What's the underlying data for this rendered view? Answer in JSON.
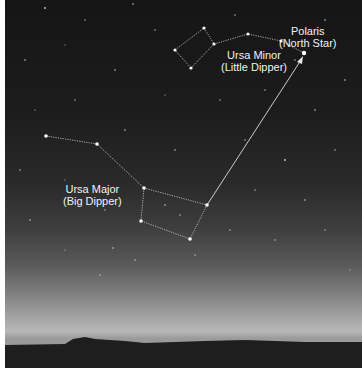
{
  "scene": "Night sky over horizon showing Ursa Major and Ursa Minor with pointer to Polaris",
  "labels": {
    "polaris": {
      "line1": "Polaris",
      "line2": "(North Star)"
    },
    "ursa_minor": {
      "line1": "Ursa Minor",
      "line2": "(Little Dipper)"
    },
    "ursa_major": {
      "line1": "Ursa Major",
      "line2": "(Big Dipper)"
    }
  },
  "constellations": {
    "ursa_minor_stars": [
      [
        170,
        50
      ],
      [
        199,
        28
      ],
      [
        209,
        44
      ],
      [
        243,
        34
      ],
      [
        276,
        41
      ],
      [
        299,
        53
      ],
      [
        186,
        68
      ]
    ],
    "ursa_major_stars": [
      [
        41,
        136
      ],
      [
        92,
        144
      ],
      [
        139,
        188
      ],
      [
        202,
        205
      ],
      [
        185,
        239
      ],
      [
        136,
        221
      ]
    ]
  },
  "colors": {
    "line": "#d0d0d0",
    "text": "#f2f2f2",
    "ground": "#1e1e1e"
  }
}
